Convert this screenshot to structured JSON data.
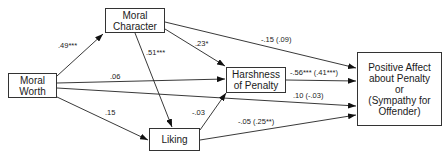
{
  "nodes": {
    "moral_worth": {
      "label": "Moral\nWorth"
    },
    "moral_character": {
      "label": "Moral\nCharacter"
    },
    "harshness": {
      "label": "Harshness\nof Penalty"
    },
    "liking": {
      "label": "Liking"
    },
    "affect": {
      "label": "Positive Affect\nabout Penalty\nor\n(Sympathy for\nOffender)"
    }
  },
  "edges": {
    "mw_mc": {
      "from": "Moral Worth",
      "to": "Moral Character",
      "label": ".49***"
    },
    "mw_harsh": {
      "from": "Moral Worth",
      "to": "Harshness of Penalty",
      "label": ".06"
    },
    "mw_affect": {
      "from": "Moral Worth",
      "to": "Positive Affect",
      "label": ".10 (-.03)"
    },
    "mw_liking": {
      "from": "Moral Worth",
      "to": "Liking",
      "label": ".15"
    },
    "mc_harsh": {
      "from": "Moral Character",
      "to": "Harshness of Penalty",
      "label": ".23*"
    },
    "mc_liking": {
      "from": "Moral Character",
      "to": "Liking",
      "label": ".51***"
    },
    "mc_affect": {
      "from": "Moral Character",
      "to": "Positive Affect",
      "label": "-.15 (.09)"
    },
    "harsh_affect": {
      "from": "Harshness of Penalty",
      "to": "Positive Affect",
      "label": "-.56*** (.41***)"
    },
    "liking_harsh": {
      "from": "Liking",
      "to": "Harshness of Penalty",
      "label": "-.03"
    },
    "liking_affect": {
      "from": "Liking",
      "to": "Positive Affect",
      "label": "-.05 (.25**)"
    }
  }
}
